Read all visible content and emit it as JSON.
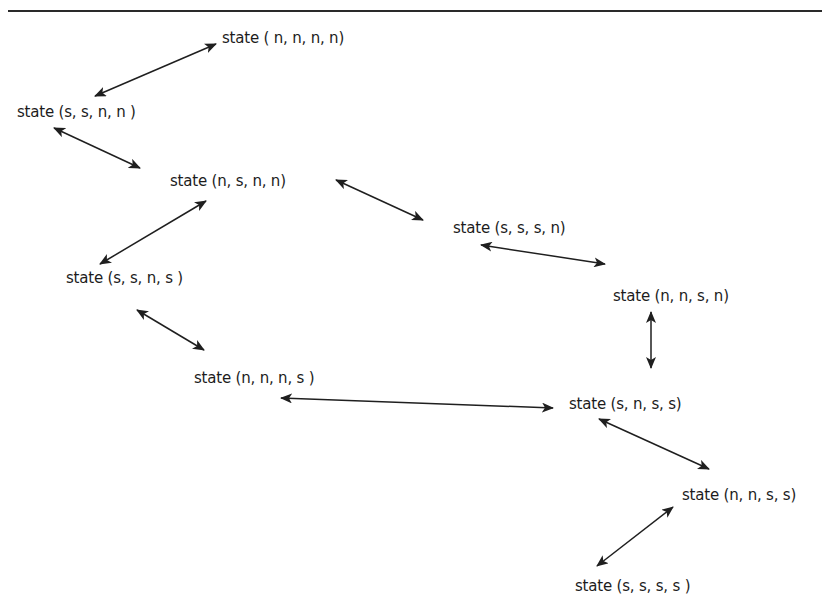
{
  "diagram": {
    "type": "state-transition-graph",
    "nodes": [
      {
        "id": "nnnn",
        "label": "state ( n, n, n, n)",
        "x": 222,
        "y": 28
      },
      {
        "id": "ssnn",
        "label": "state (s, s, n, n )",
        "x": 17,
        "y": 102
      },
      {
        "id": "nsnn",
        "label": "state (n, s, n, n)",
        "x": 170,
        "y": 171
      },
      {
        "id": "sssn",
        "label": "state (s, s, s, n)",
        "x": 453,
        "y": 218
      },
      {
        "id": "ssns",
        "label": "state (s, s, n, s )",
        "x": 66,
        "y": 268
      },
      {
        "id": "nnsn",
        "label": "state (n, n, s, n)",
        "x": 613,
        "y": 286
      },
      {
        "id": "nnns",
        "label": "state (n, n, n, s )",
        "x": 194,
        "y": 368
      },
      {
        "id": "snss",
        "label": "state (s, n, s, s)",
        "x": 569,
        "y": 394
      },
      {
        "id": "nnss",
        "label": "state (n, n, s, s)",
        "x": 682,
        "y": 485
      },
      {
        "id": "ssss",
        "label": "state (s, s, s, s )",
        "x": 575,
        "y": 576
      }
    ],
    "edges": [
      {
        "from": "nnnn",
        "to": "ssnn",
        "x1": 95,
        "y1": 96,
        "x2": 216,
        "y2": 44,
        "bidirectional": true
      },
      {
        "from": "ssnn",
        "to": "nsnn",
        "x1": 54,
        "y1": 128,
        "x2": 140,
        "y2": 168,
        "bidirectional": true
      },
      {
        "from": "nsnn",
        "to": "ssns",
        "x1": 100,
        "y1": 264,
        "x2": 206,
        "y2": 201,
        "bidirectional": true
      },
      {
        "from": "nsnn",
        "to": "sssn",
        "x1": 336,
        "y1": 180,
        "x2": 423,
        "y2": 220,
        "bidirectional": true
      },
      {
        "from": "sssn",
        "to": "nnsn",
        "x1": 481,
        "y1": 245,
        "x2": 605,
        "y2": 264,
        "bidirectional": true
      },
      {
        "from": "nnsn",
        "to": "snss",
        "x1": 651,
        "y1": 312,
        "x2": 651,
        "y2": 368,
        "bidirectional": true
      },
      {
        "from": "ssns",
        "to": "nnns",
        "x1": 137,
        "y1": 310,
        "x2": 204,
        "y2": 350,
        "bidirectional": true
      },
      {
        "from": "nnns",
        "to": "snss",
        "x1": 281,
        "y1": 398,
        "x2": 553,
        "y2": 408,
        "bidirectional": true
      },
      {
        "from": "snss",
        "to": "nnss",
        "x1": 599,
        "y1": 419,
        "x2": 709,
        "y2": 469,
        "bidirectional": true
      },
      {
        "from": "nnss",
        "to": "ssss",
        "x1": 597,
        "y1": 566,
        "x2": 673,
        "y2": 507,
        "bidirectional": true
      }
    ],
    "colors": {
      "stroke": "#1f1f1f",
      "text": "#1c1c1c",
      "background": "#ffffff"
    }
  }
}
